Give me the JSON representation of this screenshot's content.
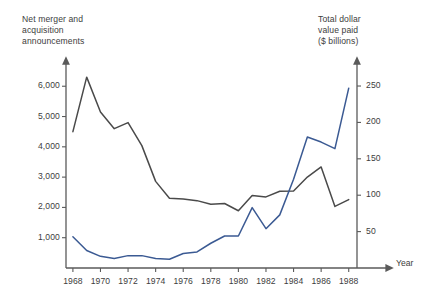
{
  "chart_data": {
    "type": "line",
    "title": "",
    "xlabel": "Year",
    "left_axis": {
      "label": "Net merger and\nacquisition\nannouncements",
      "ticks": [
        1000,
        2000,
        3000,
        4000,
        5000,
        6000
      ],
      "tick_labels": [
        "1,000",
        "2,000",
        "3,000",
        "4,000",
        "5,000",
        "6,000"
      ],
      "lim": [
        0,
        6800
      ]
    },
    "right_axis": {
      "label": "Total dollar\nvalue paid\n($ billions)",
      "ticks": [
        50,
        100,
        150,
        200,
        250
      ],
      "tick_labels": [
        "50",
        "100",
        "150",
        "200",
        "250"
      ],
      "lim": [
        0,
        283
      ]
    },
    "x": [
      1968,
      1969,
      1970,
      1971,
      1972,
      1973,
      1974,
      1975,
      1976,
      1977,
      1978,
      1979,
      1980,
      1981,
      1982,
      1983,
      1984,
      1985,
      1986,
      1987,
      1988
    ],
    "xticks": [
      1968,
      1970,
      1972,
      1974,
      1976,
      1978,
      1980,
      1982,
      1984,
      1986,
      1988
    ],
    "xtick_labels": [
      "1968",
      "1970",
      "1972",
      "1974",
      "1976",
      "1978",
      "1980",
      "1982",
      "1984",
      "1986",
      "1988"
    ],
    "xlim": [
      1967.5,
      1988.6
    ],
    "grid": false,
    "legend": "none",
    "series": [
      {
        "name": "Net merger and acquisition announcements",
        "axis": "left",
        "color": "#4a4a4a",
        "values": [
          4500,
          6300,
          5150,
          4600,
          4800,
          4040,
          2860,
          2300,
          2275,
          2224,
          2106,
          2128,
          1890,
          2395,
          2346,
          2533,
          2543,
          3001,
          3336,
          2032,
          2258
        ]
      },
      {
        "name": "Total dollar value paid ($ billions)",
        "axis": "right",
        "color": "#3b5a93",
        "values": [
          43,
          24,
          16,
          13,
          17,
          17,
          13,
          12,
          20,
          22,
          34,
          44,
          44,
          83,
          54,
          73,
          122,
          180,
          173,
          164,
          247
        ]
      }
    ]
  }
}
